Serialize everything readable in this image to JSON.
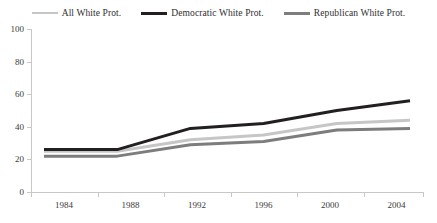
{
  "chart_data": {
    "type": "line",
    "title": "",
    "subtitle": "",
    "xlabel": "",
    "ylabel": "",
    "categories": [
      "1984",
      "1988",
      "1992",
      "1996",
      "2000",
      "2004"
    ],
    "x": [
      1984,
      1988,
      1992,
      1996,
      2000,
      2004
    ],
    "xlim": [
      1984,
      2004
    ],
    "ylim": [
      0,
      100
    ],
    "yticks": [
      0,
      20,
      40,
      60,
      80,
      100
    ],
    "ytick_labels": [
      "0",
      "20",
      "40",
      "60",
      "80",
      "100"
    ],
    "grid": false,
    "legend_position": "top",
    "series": [
      {
        "name": "All White Prot.",
        "color": "#c6c6c6",
        "values": [
          25,
          25,
          32,
          35,
          42,
          44
        ]
      },
      {
        "name": "Democratic White Prot.",
        "color": "#231f20",
        "values": [
          26,
          26,
          39,
          42,
          50,
          56
        ]
      },
      {
        "name": "Republican White Prot.",
        "color": "#7d7d7d",
        "values": [
          22,
          22,
          29,
          31,
          38,
          39
        ]
      }
    ]
  },
  "legend": {
    "items": [
      {
        "label": "All White Prot.",
        "color": "#c6c6c6",
        "width": 2
      },
      {
        "label": "Democratic White Prot.",
        "color": "#231f20",
        "width": 3
      },
      {
        "label": "Republican White Prot.",
        "color": "#7d7d7d",
        "width": 3
      }
    ]
  },
  "axes": {
    "y_labels": [
      "100",
      "80",
      "60",
      "40",
      "20",
      "0"
    ],
    "x_labels": [
      "1984",
      "1988",
      "1992",
      "1996",
      "2000",
      "2004"
    ],
    "axis_color": "#c8c8c8"
  }
}
